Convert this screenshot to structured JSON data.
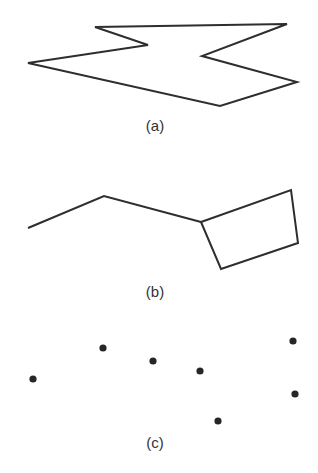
{
  "colors": {
    "stroke": "#2e2e2e",
    "dot": "#262626",
    "background": "#ffffff",
    "caption": "#333333"
  },
  "panels": [
    {
      "id": "a",
      "caption": "(a)",
      "kind": "polygon",
      "points": [
        [
          95,
          27
        ],
        [
          287,
          24
        ],
        [
          202,
          56
        ],
        [
          297,
          82
        ],
        [
          220,
          106
        ],
        [
          28,
          63
        ],
        [
          148,
          45
        ]
      ]
    },
    {
      "id": "b",
      "caption": "(b)",
      "kind": "polyline-with-quad",
      "polyline": [
        [
          28,
          228
        ],
        [
          104,
          196
        ],
        [
          201,
          222
        ]
      ],
      "quad": [
        [
          201,
          222
        ],
        [
          291,
          190
        ],
        [
          298,
          243
        ],
        [
          221,
          269
        ]
      ]
    },
    {
      "id": "c",
      "caption": "(c)",
      "kind": "points",
      "dots": [
        [
          33,
          379
        ],
        [
          103,
          348
        ],
        [
          153,
          361
        ],
        [
          200,
          371
        ],
        [
          293,
          341
        ],
        [
          295,
          394
        ],
        [
          218,
          421
        ]
      ]
    }
  ]
}
